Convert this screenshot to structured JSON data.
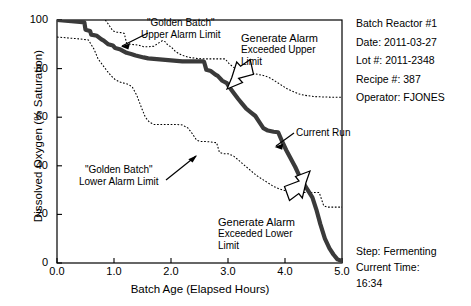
{
  "chart_data": {
    "type": "line",
    "title": "",
    "xlabel": "Batch Age (Elapsed Hours)",
    "ylabel": "Dissolved Oxygen (% Saturation)",
    "xlim": [
      0.0,
      5.0
    ],
    "ylim": [
      0,
      100
    ],
    "xticks": [
      "0.0",
      "1.0",
      "2.0",
      "3.0",
      "4.0",
      "5.0"
    ],
    "xtick_values": [
      0.0,
      1.0,
      2.0,
      3.0,
      4.0,
      5.0
    ],
    "yticks": [
      "100",
      "80",
      "60",
      "40",
      "20",
      "0"
    ],
    "ytick_values": [
      100,
      80,
      60,
      40,
      20,
      0
    ],
    "grid": false,
    "legend": "none",
    "series": [
      {
        "name": "Current Run",
        "style": "thick-solid",
        "color": "#3a3a3a",
        "x": [
          0.0,
          0.1,
          0.2,
          0.3,
          0.4,
          0.48,
          0.5,
          0.58,
          0.6,
          0.7,
          0.78,
          0.82,
          0.9,
          0.98,
          1.02,
          1.1,
          1.18,
          1.22,
          1.3,
          1.38,
          1.45,
          1.52,
          1.6,
          1.7,
          1.8,
          1.9,
          2.0,
          2.1,
          2.2,
          2.3,
          2.4,
          2.48,
          2.55,
          2.58,
          2.62,
          2.7,
          2.78,
          2.82,
          2.9,
          2.98,
          3.02,
          3.1,
          3.18,
          3.25,
          3.32,
          3.4,
          3.48,
          3.55,
          3.62,
          3.7,
          3.8,
          3.88,
          3.95,
          4.02,
          4.1,
          4.18,
          4.25,
          4.32,
          4.4,
          4.48,
          4.55,
          4.62,
          4.7,
          4.78,
          4.85,
          4.92,
          5.0
        ],
        "y": [
          100.0,
          99.8,
          99.6,
          99.4,
          99.2,
          99.0,
          96.0,
          95.5,
          94.0,
          93.5,
          92.0,
          91.5,
          90.0,
          89.5,
          88.5,
          88.0,
          87.0,
          86.5,
          86.0,
          85.4,
          85.0,
          84.6,
          84.2,
          84.0,
          83.8,
          83.6,
          83.4,
          83.2,
          83.0,
          83.0,
          83.0,
          83.0,
          83.0,
          82.8,
          79.5,
          79.0,
          77.5,
          77.0,
          75.0,
          74.0,
          72.5,
          70.0,
          67.5,
          65.5,
          63.5,
          62.0,
          60.5,
          58.0,
          55.5,
          54.5,
          54.0,
          53.8,
          50.0,
          46.5,
          43.0,
          39.5,
          36.0,
          33.0,
          30.0,
          27.0,
          22.0,
          16.0,
          10.0,
          6.0,
          3.5,
          1.5,
          0.8
        ]
      },
      {
        "name": "\"Golden Batch\" Upper Alarm Limit",
        "style": "dotted",
        "color": "#000000",
        "x": [
          0.0,
          0.2,
          0.4,
          0.6,
          0.78,
          0.88,
          0.98,
          1.05,
          1.12,
          1.18,
          1.22,
          1.3,
          1.38,
          1.45,
          1.52,
          1.6,
          1.7,
          1.78,
          1.85,
          1.9,
          1.95,
          2.0,
          2.08,
          2.15,
          2.25,
          2.35,
          2.45,
          2.55,
          2.7,
          2.85,
          2.95,
          3.02,
          3.1,
          3.18,
          3.25,
          3.35,
          3.45,
          3.55,
          3.65,
          3.75,
          3.85,
          3.95,
          4.05,
          4.15,
          4.25,
          4.35,
          4.5,
          4.7,
          4.9,
          5.0
        ],
        "y": [
          104.0,
          103.6,
          103.2,
          102.8,
          102.0,
          99.0,
          95.5,
          95.0,
          94.8,
          94.5,
          90.5,
          90.0,
          89.8,
          89.5,
          89.0,
          89.0,
          89.2,
          90.5,
          91.5,
          91.0,
          89.5,
          89.0,
          87.0,
          86.0,
          85.0,
          84.5,
          84.2,
          84.0,
          84.0,
          84.0,
          84.0,
          82.0,
          80.5,
          79.5,
          79.0,
          78.5,
          78.0,
          77.5,
          77.0,
          76.0,
          74.5,
          73.0,
          71.5,
          70.5,
          69.5,
          69.0,
          68.5,
          68.3,
          68.2,
          68.2
        ]
      },
      {
        "name": "\"Golden Batch\" Lower Alarm Limit",
        "style": "dotted",
        "color": "#000000",
        "x": [
          0.0,
          0.2,
          0.4,
          0.55,
          0.65,
          0.72,
          0.8,
          0.88,
          0.95,
          1.02,
          1.1,
          1.18,
          1.25,
          1.32,
          1.4,
          1.48,
          1.55,
          1.62,
          1.7,
          1.8,
          1.9,
          2.0,
          2.1,
          2.2,
          2.3,
          2.38,
          2.45,
          2.52,
          2.6,
          2.7,
          2.8,
          2.85,
          2.92,
          3.0,
          3.1,
          3.2,
          3.3,
          3.4,
          3.5,
          3.6,
          3.7,
          3.8,
          3.9,
          4.0,
          4.1,
          4.2,
          4.3,
          4.45,
          4.6,
          4.68,
          4.75,
          4.9,
          5.0
        ],
        "y": [
          93.0,
          92.6,
          92.2,
          91.8,
          88.0,
          84.0,
          81.5,
          79.0,
          77.0,
          75.5,
          74.5,
          74.0,
          73.5,
          72.5,
          69.0,
          64.0,
          60.0,
          58.0,
          57.0,
          57.0,
          57.0,
          57.0,
          57.0,
          56.8,
          55.5,
          53.0,
          50.5,
          50.0,
          50.0,
          49.8,
          49.5,
          45.5,
          45.0,
          45.0,
          44.0,
          42.0,
          40.0,
          38.0,
          36.0,
          34.5,
          33.0,
          31.5,
          30.5,
          29.8,
          29.2,
          29.0,
          29.0,
          29.0,
          29.0,
          23.5,
          23.0,
          23.0,
          23.0
        ]
      }
    ],
    "annotations": [
      {
        "id": "upper-alarm-limit-annotation",
        "line1": "\"Golden Batch\"",
        "line2": "Upper Alarm Limit"
      },
      {
        "id": "lower-alarm-limit-annotation",
        "line1": "\"Golden Batch\"",
        "line2": "Lower Alarm Limit"
      },
      {
        "id": "generate-alarm-upper-annotation",
        "line1": "Generate Alarm",
        "line2": "Exceeded Upper",
        "line3": "Limit"
      },
      {
        "id": "generate-alarm-lower-annotation",
        "line1": "Generate Alarm",
        "line2": "Exceeded Lower",
        "line3": "Limit"
      },
      {
        "id": "current-run-annotation",
        "line1": "Current Run"
      }
    ]
  },
  "info_panel": {
    "reactor": "Batch Reactor #1",
    "date": "Date: 2011-03-27",
    "lot": "Lot #: 2011-2348",
    "recipe": "Recipe #: 387",
    "operator": "Operator: FJONES"
  },
  "status_panel": {
    "step": "Step: Fermenting",
    "current_time_label": "Current Time:",
    "current_time_value": "16:34"
  },
  "colors": {
    "current_run": "#3a3a3a",
    "alarm_limit": "#000000",
    "axis": "#000000",
    "background": "#ffffff"
  }
}
